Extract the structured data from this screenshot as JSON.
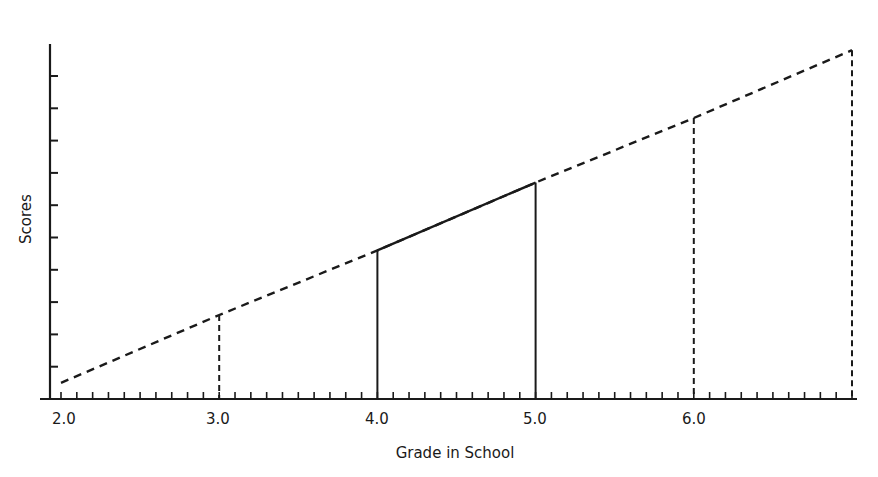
{
  "chart_data": {
    "type": "line",
    "title": "",
    "xlabel": "Grade in School",
    "ylabel": "Scores",
    "x_tick_labels": [
      "2.0",
      "3.0",
      "4.0",
      "5.0",
      "6.0"
    ],
    "x": [
      2.0,
      3.0,
      4.0,
      5.0,
      6.0,
      7.0
    ],
    "series": [
      {
        "name": "Scores by grade (extrapolated, dashed)",
        "style": "dashed",
        "x": [
          2.0,
          3.0,
          4.0,
          5.0,
          6.0,
          7.0
        ],
        "values": [
          0.5,
          2.6,
          4.6,
          6.7,
          8.7,
          10.8
        ]
      },
      {
        "name": "Scores by grade (observed, solid)",
        "style": "solid",
        "x": [
          4.0,
          5.0
        ],
        "values": [
          4.6,
          6.7
        ]
      }
    ],
    "drop_lines": [
      {
        "x": 3.0,
        "style": "dashed"
      },
      {
        "x": 4.0,
        "style": "solid"
      },
      {
        "x": 5.0,
        "style": "solid"
      },
      {
        "x": 6.0,
        "style": "dashed"
      },
      {
        "x": 7.0,
        "style": "dashed"
      }
    ],
    "xlim": [
      1.9,
      7.0
    ],
    "ylim": [
      0,
      11
    ],
    "y_ticks_unlabeled": 11,
    "x_minor_ticks_per_unit": 10,
    "grid": false,
    "legend": "none"
  },
  "labels": {
    "ylabel": "Scores",
    "xlabel": "Grade in School",
    "xticks": [
      "2.0",
      "3.0",
      "4.0",
      "5.0",
      "6.0"
    ]
  }
}
